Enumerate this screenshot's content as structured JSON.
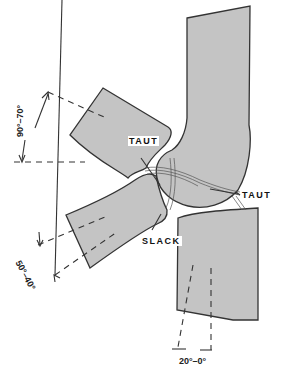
{
  "diagram": {
    "type": "anatomical joint range-of-motion diagram",
    "fill_color": "#c4c4c4",
    "stroke_color": "#333333",
    "labels": {
      "taut_upper": "TAUT",
      "taut_right": "TAUT",
      "slack": "SLACK"
    },
    "angles": {
      "upper": "90°–70°",
      "lower_left": "50°–40°",
      "bottom": "20°–0°"
    }
  }
}
